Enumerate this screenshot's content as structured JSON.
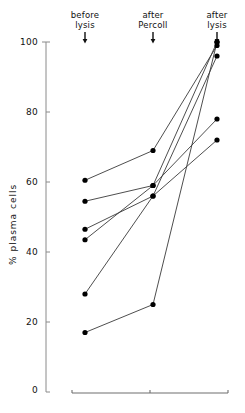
{
  "chart_data": {
    "type": "line",
    "title": "",
    "xlabel": "",
    "ylabel": "% plasma cells",
    "ylim": [
      0,
      100
    ],
    "yticks": [
      0,
      20,
      40,
      60,
      80,
      100
    ],
    "ytick_labels": [
      "0",
      "20",
      "40",
      "60",
      "80",
      "100"
    ],
    "grid": false,
    "legend": false,
    "categories": [
      "before lysis",
      "after Percoll",
      "after lysis"
    ],
    "category_lines": [
      [
        "before",
        "lysis"
      ],
      [
        "after",
        "Percoll"
      ],
      [
        "after",
        "lysis"
      ]
    ],
    "marker": "filled-circle",
    "marker_color": "#000000",
    "line_color": "#3a3a3a",
    "axis_color": "#8a8a8a",
    "series": [
      {
        "name": "sample-1",
        "values": [
          60.5,
          69,
          99
        ]
      },
      {
        "name": "sample-2",
        "values": [
          54.5,
          59,
          100
        ]
      },
      {
        "name": "sample-3",
        "values": [
          46.5,
          56,
          96
        ]
      },
      {
        "name": "sample-4",
        "values": [
          43.5,
          59,
          78
        ]
      },
      {
        "name": "sample-5",
        "values": [
          28,
          56,
          72
        ]
      },
      {
        "name": "sample-6",
        "values": [
          17,
          25,
          100
        ]
      }
    ],
    "annotations": [
      {
        "type": "arrow",
        "category": "before lysis",
        "direction": "down"
      },
      {
        "type": "arrow",
        "category": "after Percoll",
        "direction": "down"
      },
      {
        "type": "arrow",
        "category": "after lysis",
        "direction": "down"
      }
    ],
    "baseline": {
      "present": true,
      "ticks": 3
    }
  }
}
